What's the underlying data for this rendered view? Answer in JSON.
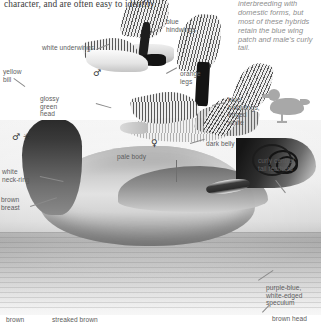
{
  "page": {
    "width": 321,
    "height": 326,
    "kind": "field-guide-plate"
  },
  "body_text": {
    "paragraph": "character, and are often easy to identify."
  },
  "side_note": {
    "text": "vary variable owing to interbreeding with domestic forms, but most of these hybrids retain the blue wing patch and male's curly tail."
  },
  "labels": [
    {
      "id": "white-underwings",
      "text": "white underwings"
    },
    {
      "id": "blue-hindwings",
      "text": "blue\nhindwings"
    },
    {
      "id": "yellow-bill",
      "text": "yellow\nbill"
    },
    {
      "id": "orange-legs",
      "text": "orange\nlegs"
    },
    {
      "id": "glossy-green-head",
      "text": "glossy\ngreen\nhead"
    },
    {
      "id": "blue-hindwings-edged-white",
      "text": "blue\nhindwings,\nedged\nwhite"
    },
    {
      "id": "pale-body",
      "text": "pale body"
    },
    {
      "id": "dark-belly",
      "text": "dark belly"
    },
    {
      "id": "curly-central-tail-feathers",
      "text": "curly central\ntail feathers"
    },
    {
      "id": "white-neck-ring",
      "text": "white\nneck-ring"
    },
    {
      "id": "brown-breast",
      "text": "brown\nbreast"
    },
    {
      "id": "purple-blue-speculum",
      "text": "purple-blue,\nwhite-edged\nspeculum"
    },
    {
      "id": "brown",
      "text": "brown"
    },
    {
      "id": "streaked-brown",
      "text": "streaked brown"
    },
    {
      "id": "brown-head",
      "text": "brown head"
    }
  ],
  "symbols": {
    "male_flying": "♂",
    "male_main": "♂ ✳",
    "female_flying": "♀"
  },
  "colors": {
    "page_background": "#ffffff",
    "body_text": "#3b3b3b",
    "label_text": "#5d5d5d",
    "side_note_text": "#8e8e8e",
    "leader_line": "#8a8a8a",
    "silhouette": "#a8a8a8"
  }
}
